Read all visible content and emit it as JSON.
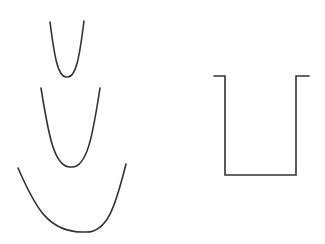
{
  "figure": {
    "width": 325,
    "height": 244,
    "background": "#ffffff",
    "stroke_color": "#333333",
    "stroke_width": 1.6
  },
  "parabolas": [
    {
      "name": "narrow-parabola",
      "left": [
        50,
        22
      ],
      "right": [
        84,
        21
      ],
      "vertex": [
        67,
        77
      ]
    },
    {
      "name": "medium-parabola",
      "left": [
        41,
        88
      ],
      "right": [
        100,
        88
      ],
      "vertex": [
        71,
        167
      ]
    },
    {
      "name": "wide-parabola",
      "left": [
        18,
        168
      ],
      "right": [
        126,
        164
      ],
      "vertex": [
        85,
        232
      ]
    }
  ],
  "square_well": {
    "name": "infinite-square-well",
    "points": [
      [
        214,
        76
      ],
      [
        225,
        76
      ],
      [
        225,
        175
      ],
      [
        296,
        175
      ],
      [
        296,
        76
      ],
      [
        309,
        76
      ]
    ]
  }
}
